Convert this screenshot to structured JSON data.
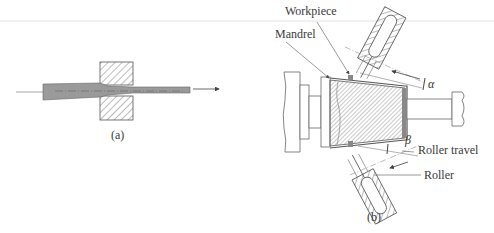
{
  "figure_a": {
    "caption": "(a)",
    "description": "Tube drawn through a die (hatched), reducing diameter; arrow indicates draw direction"
  },
  "figure_b": {
    "caption": "(b)",
    "labels": {
      "workpiece": "Workpiece",
      "mandrel": "Mandrel",
      "roller_travel": "Roller travel",
      "roller": "Roller"
    },
    "angles": {
      "alpha": "α",
      "beta": "β"
    }
  },
  "colors": {
    "line": "#555555",
    "hatch": "#6a6a6a",
    "tube_fill": "#9a9a9a",
    "background": "#ffffff"
  }
}
